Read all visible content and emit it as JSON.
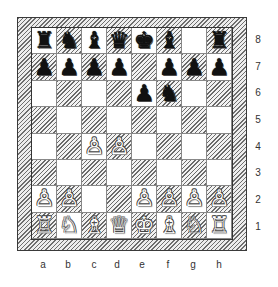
{
  "board": {
    "orientation": "white-bottom",
    "files": [
      "a",
      "b",
      "c",
      "d",
      "e",
      "f",
      "g",
      "h"
    ],
    "ranks": [
      "8",
      "7",
      "6",
      "5",
      "4",
      "3",
      "2",
      "1"
    ],
    "colors": {
      "light": "#ffffff",
      "dark_hatch": "#6a6a6a",
      "frame_hatch": "#6e6e6e",
      "border": "#333333"
    },
    "position": {
      "8": [
        "r",
        "n",
        "b",
        "q",
        "k",
        "b",
        "",
        "r"
      ],
      "7": [
        "p",
        "p",
        "p",
        "p",
        "",
        "p",
        "p",
        "p"
      ],
      "6": [
        "",
        "",
        "",
        "",
        "p",
        "n",
        "",
        ""
      ],
      "5": [
        "",
        "",
        "",
        "",
        "",
        "",
        "",
        ""
      ],
      "4": [
        "",
        "",
        "P",
        "P",
        "",
        "",
        "",
        ""
      ],
      "3": [
        "",
        "",
        "",
        "",
        "",
        "",
        "",
        ""
      ],
      "2": [
        "P",
        "P",
        "",
        "",
        "P",
        "P",
        "P",
        "P"
      ],
      "1": [
        "R",
        "N",
        "B",
        "Q",
        "K",
        "B",
        "N",
        "R"
      ]
    },
    "fen": "rnbqkb1r/pppp1ppp/4pn2/8/2PP4/8/PP2PPPP/RNBQKBNR w KQkq - 0 3"
  },
  "glyphs": {
    "K": "♔",
    "Q": "♕",
    "R": "♖",
    "B": "♗",
    "N": "♘",
    "P": "♙",
    "k": "♚",
    "q": "♛",
    "r": "♜",
    "b": "♝",
    "n": "♞",
    "p": "♟"
  },
  "icon_names": {
    "K": "white-king-icon",
    "Q": "white-queen-icon",
    "R": "white-rook-icon",
    "B": "white-bishop-icon",
    "N": "white-knight-icon",
    "P": "white-pawn-icon",
    "k": "black-king-icon",
    "q": "black-queen-icon",
    "r": "black-rook-icon",
    "b": "black-bishop-icon",
    "n": "black-knight-icon",
    "p": "black-pawn-icon"
  }
}
